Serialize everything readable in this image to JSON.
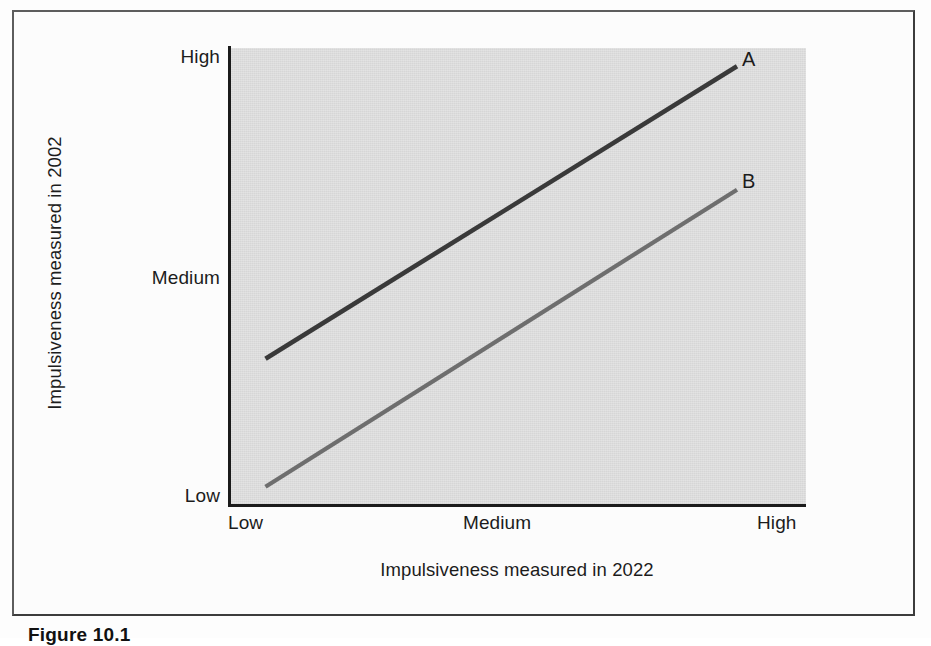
{
  "figure": {
    "caption": "Figure  10.1"
  },
  "chart_data": {
    "type": "line",
    "title": "",
    "xlabel": "Impulsiveness measured in 2022",
    "ylabel": "Impulsiveness measured in 2002",
    "x_ticks": [
      "Low",
      "Medium",
      "High"
    ],
    "y_ticks": [
      "Low",
      "Medium",
      "High"
    ],
    "xlim": [
      0,
      2
    ],
    "ylim": [
      0,
      2
    ],
    "grid": false,
    "legend_position": "line-end-labels",
    "plot_background": "#d6d6d6",
    "axis_color": "#1b1b1b",
    "series": [
      {
        "name": "A",
        "color": "#3a3a3a",
        "label": "A",
        "points": [
          {
            "x": "Low",
            "x_value": 0.12,
            "y_value": 0.64
          },
          {
            "x": "High",
            "x_value": 1.76,
            "y_value": 1.92
          }
        ]
      },
      {
        "name": "B",
        "color": "#6e6e6e",
        "label": "B",
        "points": [
          {
            "x": "Low",
            "x_value": 0.12,
            "y_value": 0.08
          },
          {
            "x": "High",
            "x_value": 1.76,
            "y_value": 1.38
          }
        ]
      }
    ]
  }
}
